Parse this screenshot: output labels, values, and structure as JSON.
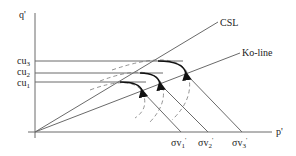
{
  "diagram": {
    "axes": {
      "y_label": "q'",
      "x_label": "p'"
    },
    "lines": {
      "csl_label": "CSL",
      "ko_label": "Ko-line"
    },
    "y_ticks": [
      {
        "base": "cu",
        "sub": "3"
      },
      {
        "base": "cu",
        "sub": "2"
      },
      {
        "base": "cu",
        "sub": "1"
      }
    ],
    "x_ticks": [
      {
        "base": "σv",
        "sub": "1",
        "prime": "'"
      },
      {
        "base": "σv",
        "sub": "2",
        "prime": "'"
      },
      {
        "base": "σv",
        "sub": "3",
        "prime": "'"
      }
    ],
    "colors": {
      "axis": "#6a6a6a",
      "line": "#6a6a6a",
      "path": "#111111",
      "dashed": "#777777"
    }
  }
}
